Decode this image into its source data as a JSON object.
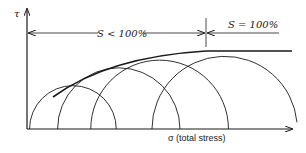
{
  "diagram": {
    "y_axis_label": "τ",
    "x_axis_label": "σ (total stress)",
    "region_labels": {
      "partial_saturation": "S < 100%",
      "full_saturation": "S = 100%"
    },
    "mohr_circles": [
      {
        "name": "circle-1",
        "sigma3": 0.01,
        "sigma1": 0.35
      },
      {
        "name": "circle-2",
        "sigma3": 0.12,
        "sigma1": 0.6
      },
      {
        "name": "circle-3",
        "sigma3": 0.25,
        "sigma1": 0.79
      },
      {
        "name": "circle-4",
        "sigma3": 0.49,
        "sigma1": 1.06
      }
    ],
    "envelope": {
      "description": "curved envelope for S < 100%, horizontal for S = 100%"
    },
    "colors": {
      "line": "#1a1a1a",
      "background": "#ffffff"
    }
  }
}
